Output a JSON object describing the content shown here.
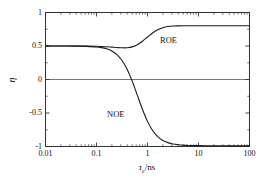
{
  "chart_data": {
    "type": "line",
    "title": "",
    "xlabel": "τc/ns",
    "ylabel": "η",
    "xscale": "log",
    "xlim": [
      0.01,
      100
    ],
    "ylim": [
      -1,
      1
    ],
    "grid": false,
    "legend_position": "inline-annotations",
    "xticks": [
      {
        "value": 0.01,
        "label": "0.01"
      },
      {
        "value": 0.1,
        "label": "0.1"
      },
      {
        "value": 1,
        "label": "1"
      },
      {
        "value": 10,
        "label": "10"
      },
      {
        "value": 100,
        "label": "100"
      }
    ],
    "yticks": [
      {
        "value": 1,
        "label": "1"
      },
      {
        "value": 0.5,
        "label": "0.5"
      },
      {
        "value": 0,
        "label": "0"
      },
      {
        "value": -0.5,
        "label": "-0.5"
      },
      {
        "value": -1,
        "label": "-1"
      }
    ],
    "reference_lines": [
      {
        "orientation": "horizontal",
        "value": 0,
        "color": "#555555"
      }
    ],
    "series": [
      {
        "name": "ROE",
        "color": "#1a1a1a",
        "annotation": "ROE",
        "x": [
          0.01,
          0.0158,
          0.0251,
          0.0398,
          0.0631,
          0.1,
          0.1259,
          0.1585,
          0.1995,
          0.2512,
          0.3162,
          0.3981,
          0.5012,
          0.631,
          0.7943,
          1.0,
          1.259,
          1.585,
          1.995,
          2.512,
          3.162,
          3.981,
          5.012,
          6.31,
          7.943,
          10.0,
          15.85,
          25.12,
          39.81,
          63.1,
          100.0
        ],
        "y": [
          0.5,
          0.5,
          0.5,
          0.499,
          0.499,
          0.496,
          0.493,
          0.489,
          0.483,
          0.477,
          0.473,
          0.474,
          0.487,
          0.519,
          0.571,
          0.634,
          0.694,
          0.742,
          0.773,
          0.79,
          0.798,
          0.801,
          0.802,
          0.802,
          0.802,
          0.802,
          0.802,
          0.802,
          0.802,
          0.802,
          0.802
        ]
      },
      {
        "name": "NOE",
        "color": "#1a1a1a",
        "annotation": "NOE",
        "x": [
          0.01,
          0.0158,
          0.0251,
          0.0398,
          0.0631,
          0.1,
          0.1259,
          0.1585,
          0.1995,
          0.2512,
          0.3162,
          0.3981,
          0.5012,
          0.631,
          0.7943,
          1.0,
          1.259,
          1.585,
          1.995,
          2.512,
          3.162,
          3.981,
          5.012,
          6.31,
          7.943,
          10.0,
          15.85,
          25.12,
          39.81,
          63.1,
          100.0
        ],
        "y": [
          0.5,
          0.5,
          0.499,
          0.498,
          0.494,
          0.486,
          0.476,
          0.458,
          0.426,
          0.371,
          0.283,
          0.152,
          -0.024,
          -0.233,
          -0.444,
          -0.625,
          -0.762,
          -0.853,
          -0.909,
          -0.942,
          -0.962,
          -0.973,
          -0.98,
          -0.984,
          -0.986,
          -0.987,
          -0.989,
          -0.989,
          -0.99,
          -0.99,
          -0.99
        ]
      }
    ]
  },
  "axes": {
    "frame_color": "#333333",
    "background": "#ffffff"
  }
}
